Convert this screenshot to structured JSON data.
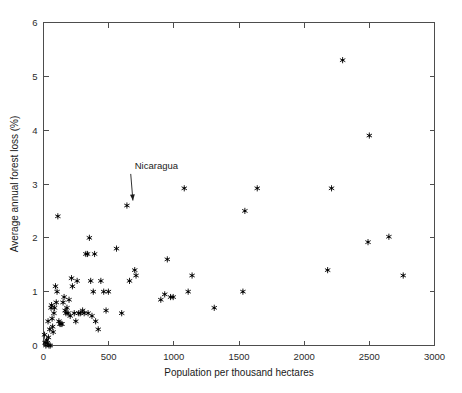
{
  "chart_data": {
    "type": "scatter",
    "title": "",
    "xlabel": "Population per thousand hectares",
    "ylabel": "Average annual forest loss (%)",
    "xlim": [
      0,
      3000
    ],
    "ylim": [
      0,
      6
    ],
    "xticks": [
      0,
      500,
      1000,
      1500,
      2000,
      2500,
      3000
    ],
    "yticks": [
      0,
      1,
      2,
      3,
      4,
      5,
      6
    ],
    "xticklabels": [
      "0",
      "500",
      "1000",
      "1500",
      "2000",
      "2500",
      "3000"
    ],
    "yticklabels": [
      "0",
      "1",
      "2",
      "3",
      "4",
      "5",
      "6"
    ],
    "grid": false,
    "legend": null,
    "marker": "asterisk",
    "marker_color": "#000000",
    "points": [
      [
        8,
        0.2
      ],
      [
        12,
        0.05
      ],
      [
        18,
        0.0
      ],
      [
        25,
        0.1
      ],
      [
        30,
        0.05
      ],
      [
        35,
        0.45
      ],
      [
        38,
        0.15
      ],
      [
        42,
        0.0
      ],
      [
        48,
        0.3
      ],
      [
        52,
        0.0
      ],
      [
        58,
        0.7
      ],
      [
        62,
        0.75
      ],
      [
        66,
        0.5
      ],
      [
        70,
        0.35
      ],
      [
        74,
        0.25
      ],
      [
        80,
        0.6
      ],
      [
        85,
        0.7
      ],
      [
        92,
        1.1
      ],
      [
        98,
        0.8
      ],
      [
        104,
        1.0
      ],
      [
        110,
        2.4
      ],
      [
        118,
        0.45
      ],
      [
        126,
        0.4
      ],
      [
        134,
        0.4
      ],
      [
        142,
        0.4
      ],
      [
        150,
        0.8
      ],
      [
        158,
        0.9
      ],
      [
        166,
        0.65
      ],
      [
        172,
        0.6
      ],
      [
        180,
        0.7
      ],
      [
        188,
        0.6
      ],
      [
        196,
        0.85
      ],
      [
        205,
        0.55
      ],
      [
        215,
        1.25
      ],
      [
        222,
        1.1
      ],
      [
        236,
        0.6
      ],
      [
        248,
        0.45
      ],
      [
        258,
        1.2
      ],
      [
        270,
        0.6
      ],
      [
        282,
        0.6
      ],
      [
        300,
        0.65
      ],
      [
        312,
        0.6
      ],
      [
        325,
        1.7
      ],
      [
        338,
        1.7
      ],
      [
        342,
        0.6
      ],
      [
        352,
        2.0
      ],
      [
        362,
        1.2
      ],
      [
        372,
        0.55
      ],
      [
        382,
        1.0
      ],
      [
        392,
        1.7
      ],
      [
        400,
        0.45
      ],
      [
        420,
        0.3
      ],
      [
        440,
        1.2
      ],
      [
        462,
        1.0
      ],
      [
        480,
        0.65
      ],
      [
        498,
        1.0
      ],
      [
        560,
        1.8
      ],
      [
        600,
        0.6
      ],
      [
        640,
        2.6
      ],
      [
        660,
        1.2
      ],
      [
        700,
        1.4
      ],
      [
        710,
        1.3
      ],
      [
        900,
        0.85
      ],
      [
        930,
        0.95
      ],
      [
        950,
        1.6
      ],
      [
        975,
        0.9
      ],
      [
        995,
        0.9
      ],
      [
        1080,
        2.92
      ],
      [
        1110,
        1.0
      ],
      [
        1140,
        1.3
      ],
      [
        1310,
        0.7
      ],
      [
        1530,
        1.0
      ],
      [
        1545,
        2.5
      ],
      [
        1640,
        2.92
      ],
      [
        2180,
        1.4
      ],
      [
        2210,
        2.92
      ],
      [
        2295,
        5.3
      ],
      [
        2490,
        1.92
      ],
      [
        2500,
        3.9
      ],
      [
        2650,
        2.02
      ],
      [
        2760,
        1.3
      ]
    ],
    "annotations": [
      {
        "text": "Nicaragua",
        "label_x": 700,
        "label_y": 3.28,
        "point_x": 640,
        "point_y": 2.6
      }
    ]
  }
}
